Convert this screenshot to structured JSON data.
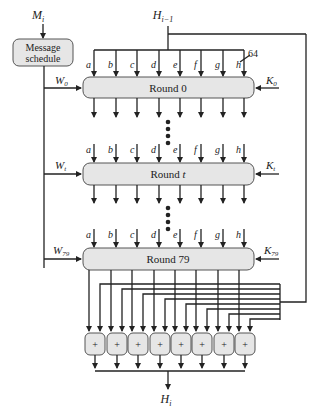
{
  "diagram": {
    "input_message": {
      "base": "M",
      "sub": "i"
    },
    "input_hash": {
      "base": "H",
      "sub": "i−1"
    },
    "output_hash": {
      "base": "H",
      "sub": "i"
    },
    "message_schedule": {
      "line1": "Message",
      "line2": "schedule"
    },
    "word_width_label": "64",
    "registers": [
      "a",
      "b",
      "c",
      "d",
      "e",
      "f",
      "g",
      "h"
    ],
    "rounds": [
      {
        "label": "Round 0",
        "w": {
          "base": "W",
          "sub": "0"
        },
        "k": {
          "base": "K",
          "sub": "0"
        }
      },
      {
        "label_prefix": "Round ",
        "label_var": "t",
        "w": {
          "base": "W",
          "sub": "t"
        },
        "k": {
          "base": "K",
          "sub": "t"
        }
      },
      {
        "label": "Round 79",
        "w": {
          "base": "W",
          "sub": "79"
        },
        "k": {
          "base": "K",
          "sub": "79"
        }
      }
    ],
    "adder_symbol": "+",
    "adder_count": 8,
    "colors": {
      "box_fill": "#e6e6e6",
      "line": "#222222",
      "box_stroke": "#555555"
    }
  }
}
